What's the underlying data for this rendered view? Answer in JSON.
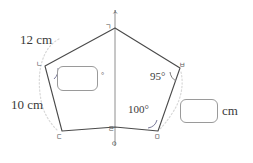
{
  "figure": {
    "type": "geometry-diagram",
    "stroke_color": "#4a4a4a",
    "guide_color": "#c9c9c9",
    "box_border_color": "#9a9a9a"
  },
  "vertices": {
    "top_axis": "ㅅ",
    "apex": "ㄱ",
    "upper_left": "ㄴ",
    "lower_left": "ㄷ",
    "bottom_center": "ㄹ",
    "bottom_axis": "ㅇ",
    "lower_right": "ㅁ",
    "upper_right": "ㅂ"
  },
  "side_labels": {
    "top_left_side": "12 cm",
    "left_side": "10 cm"
  },
  "angle_labels": {
    "upper_right_angle": "95°",
    "lower_right_angle": "100°"
  },
  "answer_boxes": {
    "left": {
      "value": "",
      "suffix": "°"
    },
    "right": {
      "value": "",
      "suffix": "cm"
    }
  },
  "geometry": {
    "points": {
      "apex": [
        115,
        28
      ],
      "upper_left": [
        45,
        66
      ],
      "lower_left": [
        62,
        131
      ],
      "bottom_center": [
        115,
        127
      ],
      "lower_right": [
        158,
        131
      ],
      "upper_right": [
        180,
        68
      ]
    },
    "axis_line": {
      "x": 115,
      "y_top": 10,
      "y_bottom": 146
    }
  }
}
